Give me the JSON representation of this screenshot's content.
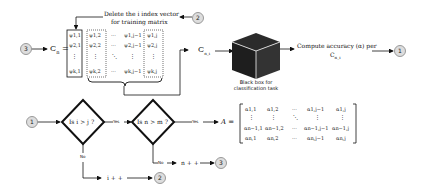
{
  "top_row": {
    "start_marker": "3",
    "c_label": "C",
    "c_sub": "n",
    "equals": "=",
    "delete_note_line1": "Delete the i index vector",
    "delete_note_line2": "for training matrix",
    "delete_marker": "2",
    "cn_label": "C",
    "cn_sub": "n_i",
    "black_box_line1": "Black box for",
    "black_box_line2": "classification task",
    "compute_line1": "Compute accuracy (α) per",
    "compute_line2": "C",
    "compute_sub": "n_i",
    "end_marker": "1"
  },
  "psi_matrix": {
    "rows": [
      [
        "ψ1,1",
        "ψ1,2",
        "···",
        "ψ1,j−1",
        "ψ1,j"
      ],
      [
        "ψ2,1",
        "ψ2,2",
        "···",
        "ψ2,j−1",
        "ψ2,j"
      ],
      [
        "⋮",
        "⋮",
        "⋱",
        "⋮",
        "⋮"
      ],
      [
        "ψk,1",
        "ψk,2",
        "···",
        "ψk,j−1",
        "ψk,j"
      ]
    ]
  },
  "bottom_row": {
    "start_marker": "1",
    "decision1": "Is i > j ?",
    "decision2": "Is n > m ?",
    "yes1": "Yes",
    "yes2": "Yes",
    "no1": "No",
    "no2": "No",
    "i_inc": "i + +",
    "i_marker": "2",
    "n_inc": "n + +",
    "n_marker": "3",
    "a_label": "A ="
  },
  "alpha_matrix": {
    "rows": [
      [
        "α1,1",
        "α1,2",
        "···",
        "α1,j−1",
        "α1,j"
      ],
      [
        "⋮",
        "⋮",
        "⋱",
        "⋮",
        "⋮"
      ],
      [
        "αn−1,1",
        "αn−1,2",
        "···",
        "αn−1,j−1",
        "αn−1,j"
      ],
      [
        "αn,1",
        "αn,2",
        "···",
        "αn,j−1",
        "αn,j"
      ]
    ]
  }
}
